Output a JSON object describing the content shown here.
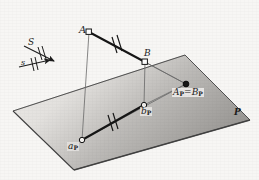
{
  "figure": {
    "background_color": "#f7f6f4",
    "ink_color": "#1c1c1c",
    "plane": {
      "label": "P",
      "fill_light": "#eceae7",
      "fill_dark": "#9d9b99",
      "edge_color": "#4a4a4a",
      "corners": [
        {
          "name": "left",
          "x": 13,
          "y": 111
        },
        {
          "name": "top",
          "x": 185,
          "y": 55
        },
        {
          "name": "right",
          "x": 250,
          "y": 120
        },
        {
          "name": "bottom",
          "x": 74,
          "y": 170
        }
      ]
    },
    "points": [
      {
        "id": "A",
        "label": "A",
        "sub": "",
        "x": 89,
        "y": 32,
        "marker": "open-square",
        "on_plane": false
      },
      {
        "id": "B",
        "label": "B",
        "sub": "",
        "x": 145,
        "y": 62,
        "marker": "open-square",
        "on_plane": false
      },
      {
        "id": "ap",
        "label": "a",
        "sub": "P",
        "x": 82,
        "y": 140,
        "marker": "open-circle",
        "on_plane": true
      },
      {
        "id": "bp",
        "label": "b",
        "sub": "P",
        "x": 144,
        "y": 105,
        "marker": "open-circle",
        "on_plane": true
      },
      {
        "id": "ApBp",
        "label": "A",
        "sub": "P",
        "x": 186,
        "y": 84,
        "marker": "filled-dot",
        "on_plane": true
      }
    ],
    "labels": {
      "A": "A",
      "B": "B",
      "ApBp_left": "A",
      "ApBp_eq": "=",
      "ApBp_right": "B",
      "sub_P": "P",
      "bp": "b",
      "ap": "a",
      "plane": "P",
      "direction_upper": "S",
      "direction_lower": "s"
    },
    "segments": [
      {
        "name": "AB",
        "from": "A",
        "to": "B",
        "style": "thick-solid",
        "ticks": 2
      },
      {
        "name": "ap-bp",
        "from": "ap",
        "to": "bp",
        "style": "thick-solid",
        "ticks": 2
      },
      {
        "name": "A-ap",
        "from": "A",
        "to": "ap",
        "style": "thin-solid",
        "ticks": 0
      },
      {
        "name": "B-bp",
        "from": "B",
        "to": "bp",
        "style": "thin-solid",
        "ticks": 0
      },
      {
        "name": "A-ApBp",
        "from": "A",
        "to": "ApBp",
        "style": "thin-solid",
        "ticks": 0
      },
      {
        "name": "B-ApBp",
        "from": "B",
        "to": "ApBp",
        "style": "thin-solid",
        "ticks": 0
      },
      {
        "name": "ap-ApBp",
        "from": "ap",
        "to": "ApBp",
        "style": "thin-solid",
        "ticks": 0
      },
      {
        "name": "bp-ApBp",
        "from": "bp",
        "to": "ApBp",
        "style": "thin-solid",
        "ticks": 0
      }
    ],
    "direction_arrows": [
      {
        "name": "S-arrow",
        "x1": 24,
        "y1": 46,
        "x2": 56,
        "y2": 62,
        "ticks": 2
      },
      {
        "name": "s-arrow",
        "x1": 19,
        "y1": 66,
        "x2": 52,
        "y2": 60,
        "ticks": 2
      }
    ]
  }
}
